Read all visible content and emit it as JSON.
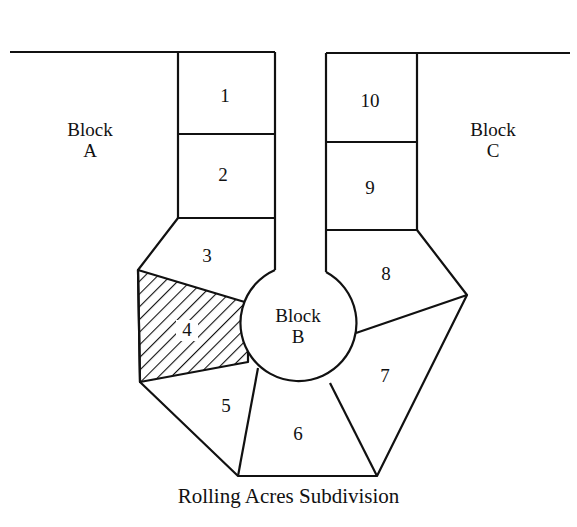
{
  "diagram": {
    "caption": "Rolling Acres Subdivision",
    "colors": {
      "line": "#111111",
      "background": "#ffffff",
      "hatch": "#111111"
    },
    "blocks": [
      {
        "id": "A",
        "label_line1": "Block",
        "label_line2": "A"
      },
      {
        "id": "B",
        "label_line1": "Block",
        "label_line2": "B"
      },
      {
        "id": "C",
        "label_line1": "Block",
        "label_line2": "C"
      }
    ],
    "lots": [
      {
        "number": "1"
      },
      {
        "number": "2"
      },
      {
        "number": "3"
      },
      {
        "number": "4",
        "highlighted": true,
        "pattern": "diagonal-hatch"
      },
      {
        "number": "5"
      },
      {
        "number": "6"
      },
      {
        "number": "7"
      },
      {
        "number": "8"
      },
      {
        "number": "9"
      },
      {
        "number": "10"
      }
    ]
  }
}
